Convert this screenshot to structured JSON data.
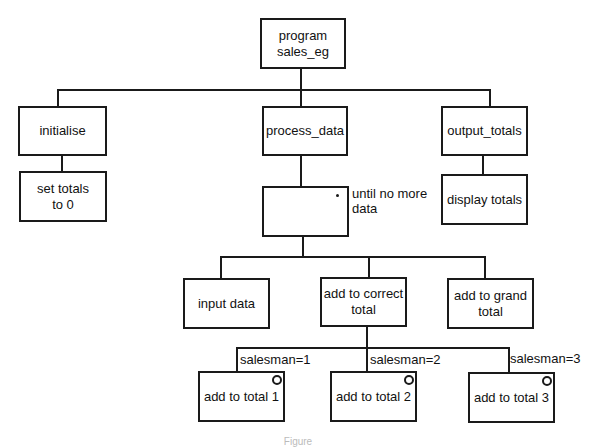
{
  "diagram": {
    "type": "Jackson structure diagram",
    "root": {
      "label_line1": "program",
      "label_line2": "sales_eg"
    },
    "level1": [
      {
        "label": "initialise"
      },
      {
        "label": "process_data"
      },
      {
        "label": "output_totals"
      }
    ],
    "level2": {
      "initialise_child": {
        "label_line1": "set totals",
        "label_line2": "to 0"
      },
      "process_iteration": {
        "marker": "*",
        "condition_line1": "until no more",
        "condition_line2": "data"
      },
      "output_child": {
        "label": "display totals"
      }
    },
    "level3": [
      {
        "label": "input data"
      },
      {
        "label_line1": "add to correct",
        "label_line2": "total"
      },
      {
        "label_line1": "add to grand",
        "label_line2": "total"
      }
    ],
    "level4": [
      {
        "label": "add to total 1",
        "condition": "salesman=1",
        "marker": "o"
      },
      {
        "label": "add to total 2",
        "condition": "salesman=2",
        "marker": "o"
      },
      {
        "label": "add to total 3",
        "condition": "salesman=3",
        "marker": "o"
      }
    ],
    "caption": "Figure"
  }
}
